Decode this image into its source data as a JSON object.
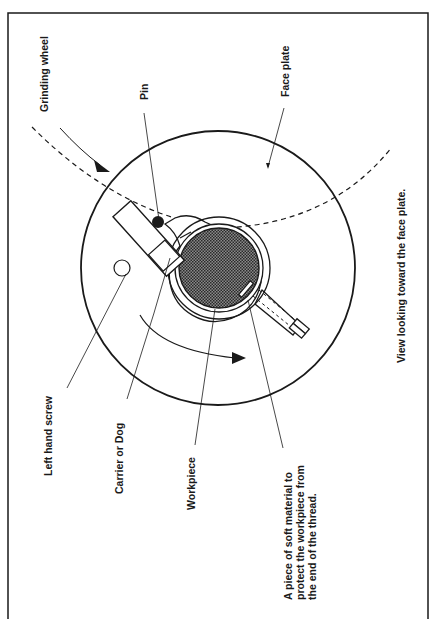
{
  "figure": {
    "orientation": "rotated-90-ccw",
    "caption": "View looking toward the face plate.",
    "colors": {
      "stroke": "#1a1a1a",
      "background": "#ffffff",
      "workpiece_fill": "#555555"
    }
  },
  "labels": {
    "grinding_wheel": "Grinding wheel",
    "pin": "Pin",
    "face_plate": "Face plate",
    "left_hand_screw": "Left hand screw",
    "carrier_or_dog": "Carrier or Dog",
    "workpiece": "Workpiece",
    "soft_material_line1": "A piece of soft material to",
    "soft_material_line2": "protect the workpiece from",
    "soft_material_line3": "the end of the thread."
  },
  "components": [
    {
      "name": "grinding-wheel",
      "style": "dashed-arc"
    },
    {
      "name": "face-plate",
      "style": "circle"
    },
    {
      "name": "carrier-dog",
      "style": "clamp"
    },
    {
      "name": "pin",
      "style": "filled-dot"
    },
    {
      "name": "left-hand-screw",
      "style": "open-circle"
    },
    {
      "name": "workpiece",
      "style": "crosshatched-circle"
    },
    {
      "name": "soft-material-pad",
      "style": "small-rect"
    },
    {
      "name": "rotation-arrow",
      "style": "curved-arrow"
    }
  ]
}
